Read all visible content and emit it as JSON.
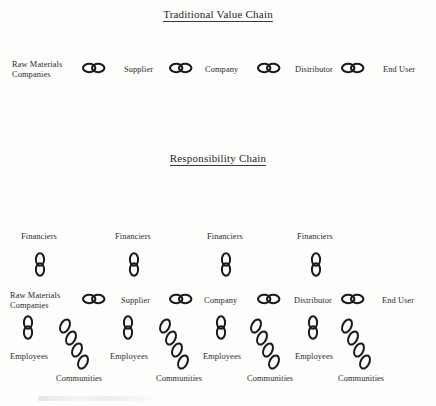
{
  "document": {
    "sections": [
      {
        "id": "traditional",
        "title": "Traditional Value Chain"
      },
      {
        "id": "responsibility",
        "title": "Responsibility Chain"
      }
    ]
  },
  "colors": {
    "ink": "#1b1b1b",
    "text": "#2b2b2b",
    "background": "#fdfdfc"
  },
  "traditional_chain": {
    "nodes": [
      {
        "label": "Raw Materials\nCompanies",
        "x": 12,
        "y": 60
      },
      {
        "label": "Supplier",
        "x": 124,
        "y": 65
      },
      {
        "label": "Company",
        "x": 205,
        "y": 65
      },
      {
        "label": "Distributor",
        "x": 295,
        "y": 65
      },
      {
        "label": "End User",
        "x": 383,
        "y": 65
      }
    ],
    "links": [
      {
        "name": "link-raw-to-supplier",
        "x": 82,
        "y": 62
      },
      {
        "name": "link-supplier-to-company",
        "x": 169,
        "y": 62
      },
      {
        "name": "link-company-to-distributor",
        "x": 257,
        "y": 62
      },
      {
        "name": "link-distributor-to-enduser",
        "x": 341,
        "y": 62
      }
    ]
  },
  "responsibility_chain": {
    "main_nodes": [
      {
        "label": "Raw Materials\nCompanies",
        "x": 10,
        "y": 291
      },
      {
        "label": "Supplier",
        "x": 121,
        "y": 296
      },
      {
        "label": "Company",
        "x": 204,
        "y": 296
      },
      {
        "label": "Distributor",
        "x": 294,
        "y": 296
      },
      {
        "label": "End User",
        "x": 382,
        "y": 296
      }
    ],
    "main_links": [
      {
        "name": "link-raw-to-supplier",
        "x": 82,
        "y": 293
      },
      {
        "name": "link-supplier-to-company",
        "x": 169,
        "y": 293
      },
      {
        "name": "link-company-to-distributor",
        "x": 257,
        "y": 293
      },
      {
        "name": "link-distributor-to-enduser",
        "x": 341,
        "y": 293
      }
    ],
    "financiers": [
      {
        "label": "Financiers",
        "label_x": 21,
        "label_y": 232,
        "link_x": 34,
        "link_y": 252
      },
      {
        "label": "Financiers",
        "label_x": 115,
        "label_y": 232,
        "link_x": 128,
        "link_y": 252
      },
      {
        "label": "Financiers",
        "label_x": 207,
        "label_y": 232,
        "link_x": 220,
        "link_y": 252
      },
      {
        "label": "Financiers",
        "label_x": 297,
        "label_y": 232,
        "link_x": 310,
        "link_y": 252
      }
    ],
    "employees": [
      {
        "label": "Employees",
        "label_x": 10,
        "label_y": 352,
        "link_x": 22,
        "link_y": 315
      },
      {
        "label": "Employees",
        "label_x": 110,
        "label_y": 352,
        "link_x": 122,
        "link_y": 315
      },
      {
        "label": "Employees",
        "label_x": 203,
        "label_y": 352,
        "link_x": 215,
        "link_y": 315
      },
      {
        "label": "Employees",
        "label_x": 295,
        "label_y": 352,
        "link_x": 307,
        "link_y": 315
      }
    ],
    "communities": [
      {
        "label": "Communities",
        "label_x": 56,
        "label_y": 374,
        "link_x": 56,
        "link_y": 318
      },
      {
        "label": "Communities",
        "label_x": 156,
        "label_y": 374,
        "link_x": 156,
        "link_y": 318
      },
      {
        "label": "Communities",
        "label_x": 247,
        "label_y": 374,
        "link_x": 247,
        "link_y": 318
      },
      {
        "label": "Communities",
        "label_x": 338,
        "label_y": 374,
        "link_x": 338,
        "link_y": 318
      }
    ]
  }
}
